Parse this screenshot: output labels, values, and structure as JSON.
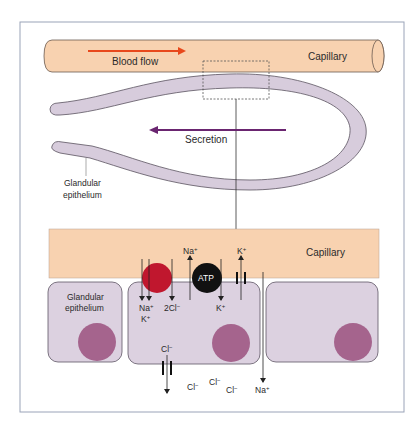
{
  "colors": {
    "capillary_fill": "#F8D2B0",
    "capillary_stroke": "#6b5a50",
    "gland_fill": "#D7CCDC",
    "gland_stroke": "#5a5360",
    "cell_fill": "#DCD1E0",
    "cell_stroke": "#5e5664",
    "nucleus_fill": "#A5648D",
    "blood_flow_arrow": "#E8481C",
    "secretion_arrow": "#6A2570",
    "cotransporter_fill": "#C0172E",
    "pump_fill": "#111111",
    "frame_stroke": "#9aa3b8",
    "line": "#333333"
  },
  "top_panel": {
    "capillary_label": "Capillary",
    "blood_flow_label": "Blood flow",
    "secretion_label": "Secretion",
    "gland_label_line1": "Glandular",
    "gland_label_line2": "epithelium",
    "zoom_box": "dashed detail region"
  },
  "bottom_panel": {
    "capillary_label": "Capillary",
    "gland_label_line1": "Glandular",
    "gland_label_line2": "epithelium",
    "cotransporter": {
      "ions_in_1": "Na",
      "ions_in_1_charge": "+",
      "ions_in_2": "K",
      "ions_in_2_charge": "+",
      "ions_in_3": "2Cl",
      "ions_in_3_charge": "−"
    },
    "pump": {
      "label": "ATP",
      "out_ion": "Na",
      "out_charge": "+",
      "in_ion": "K",
      "in_charge": "+"
    },
    "k_channel": {
      "ion": "K",
      "charge": "+"
    },
    "cl_channel": {
      "ion": "Cl",
      "charge": "−"
    },
    "lumen_ions": [
      {
        "ion": "Cl",
        "charge": "−"
      },
      {
        "ion": "Cl",
        "charge": "−"
      },
      {
        "ion": "Cl",
        "charge": "−"
      }
    ],
    "paracellular": {
      "ion": "Na",
      "charge": "+"
    }
  }
}
